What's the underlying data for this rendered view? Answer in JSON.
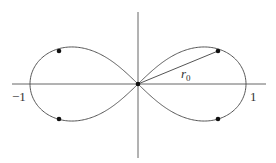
{
  "figure": {
    "labels": {
      "left_intercept": "−1",
      "right_intercept": "1",
      "radius_label": "r",
      "radius_subscript": "0"
    },
    "points": [
      {
        "name": "origin",
        "x": 0,
        "y": 0
      },
      {
        "name": "upper-right",
        "x": 0.75,
        "y": 0.31
      },
      {
        "name": "lower-right",
        "x": 0.75,
        "y": -0.31
      },
      {
        "name": "upper-left",
        "x": -0.75,
        "y": 0.31
      },
      {
        "name": "lower-left",
        "x": -0.75,
        "y": -0.31
      }
    ],
    "colors": {
      "stroke": "#555555",
      "dot": "#111111"
    }
  }
}
